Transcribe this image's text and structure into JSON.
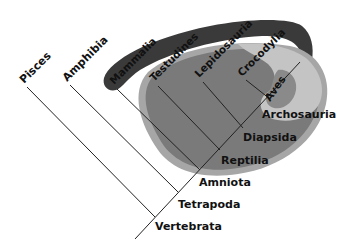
{
  "diagram": {
    "type": "cladogram",
    "colors": {
      "background": "#ffffff",
      "mammalia_band": "#3a3a3a",
      "reptilia_outer_ring": "#a6a6a6",
      "reptilia_fill": "#7a7a7a",
      "aves_outer": "#c4c4c4",
      "aves_inner": "#8a8a8a",
      "line": "#222222",
      "text": "#111111"
    },
    "terminal_taxa": [
      {
        "id": "pisces",
        "label": "Pisces"
      },
      {
        "id": "amphibia",
        "label": "Amphibia"
      },
      {
        "id": "mammalia",
        "label": "Mammalia"
      },
      {
        "id": "testudines",
        "label": "Testudines"
      },
      {
        "id": "lepidosauria",
        "label": "Lepidosauria"
      },
      {
        "id": "crocodylia",
        "label": "Crocodylia"
      },
      {
        "id": "aves",
        "label": "Aves"
      }
    ],
    "clades": [
      {
        "id": "archosauria",
        "label": "Archosauria"
      },
      {
        "id": "diapsida",
        "label": "Diapsida"
      },
      {
        "id": "reptilia",
        "label": "Reptilia"
      },
      {
        "id": "amniota",
        "label": "Amniota"
      },
      {
        "id": "tetrapoda",
        "label": "Tetrapoda"
      },
      {
        "id": "vertebrata",
        "label": "Vertebrata"
      }
    ]
  }
}
